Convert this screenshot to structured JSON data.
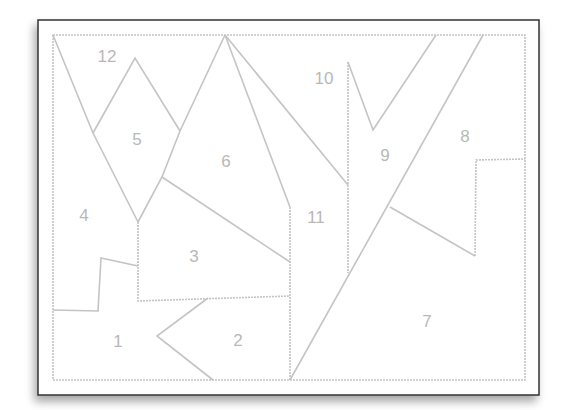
{
  "diagram": {
    "title": "",
    "type": "numbered-region puzzle",
    "colors": {
      "frame": "#333333",
      "lines": "#c4c4c4",
      "labels": "#b8b8b8",
      "background": "#ffffff"
    },
    "regions": [
      {
        "id": "1",
        "label": "1",
        "x": 118,
        "y": 347
      },
      {
        "id": "2",
        "label": "2",
        "x": 238,
        "y": 346
      },
      {
        "id": "3",
        "label": "3",
        "x": 194,
        "y": 262
      },
      {
        "id": "4",
        "label": "4",
        "x": 84,
        "y": 221
      },
      {
        "id": "5",
        "label": "5",
        "x": 137,
        "y": 145
      },
      {
        "id": "6",
        "label": "6",
        "x": 226,
        "y": 167
      },
      {
        "id": "7",
        "label": "7",
        "x": 427,
        "y": 327
      },
      {
        "id": "8",
        "label": "8",
        "x": 465,
        "y": 142
      },
      {
        "id": "9",
        "label": "9",
        "x": 385,
        "y": 161
      },
      {
        "id": "10",
        "label": "10",
        "x": 324,
        "y": 84
      },
      {
        "id": "11",
        "label": "11",
        "x": 316,
        "y": 223
      },
      {
        "id": "12",
        "label": "12",
        "x": 107,
        "y": 62
      }
    ]
  }
}
